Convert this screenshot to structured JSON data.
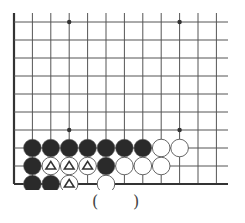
{
  "diagram": {
    "type": "go-problem",
    "grid": {
      "columns": 12,
      "rows": 10,
      "left_edge_col": 0,
      "bottom_edge_row": 9,
      "origin_x": 14,
      "origin_y": 22,
      "col_spacing": 18.4,
      "row_spacing": 18,
      "line_right_extent": 228,
      "line_top_extent": 13,
      "star_points": [
        [
          3,
          0
        ],
        [
          9,
          0
        ],
        [
          3,
          6
        ],
        [
          9,
          6
        ]
      ]
    },
    "colors": {
      "line": "#555555",
      "edge": "#333333",
      "black_stone": "#2a2a2a",
      "white_stone": "#ffffff",
      "stone_outline": "#555555",
      "marker": "#333333"
    },
    "stones": [
      {
        "color": "black",
        "col": 1,
        "row": 7
      },
      {
        "color": "black",
        "col": 2,
        "row": 7
      },
      {
        "color": "black",
        "col": 3,
        "row": 7
      },
      {
        "color": "black",
        "col": 4,
        "row": 7
      },
      {
        "color": "black",
        "col": 5,
        "row": 7
      },
      {
        "color": "black",
        "col": 6,
        "row": 7
      },
      {
        "color": "black",
        "col": 7,
        "row": 7
      },
      {
        "color": "white",
        "col": 8,
        "row": 7
      },
      {
        "color": "white",
        "col": 9,
        "row": 7
      },
      {
        "color": "black",
        "col": 1,
        "row": 8
      },
      {
        "color": "white",
        "col": 2,
        "row": 8,
        "marker": "triangle"
      },
      {
        "color": "white",
        "col": 3,
        "row": 8,
        "marker": "triangle"
      },
      {
        "color": "white",
        "col": 4,
        "row": 8,
        "marker": "triangle"
      },
      {
        "color": "black",
        "col": 5,
        "row": 8
      },
      {
        "color": "white",
        "col": 6,
        "row": 8
      },
      {
        "color": "white",
        "col": 7,
        "row": 8
      },
      {
        "color": "white",
        "col": 8,
        "row": 8
      },
      {
        "color": "black",
        "col": 1,
        "row": 9
      },
      {
        "color": "black",
        "col": 2,
        "row": 9
      },
      {
        "color": "white",
        "col": 3,
        "row": 9,
        "marker": "triangle"
      },
      {
        "color": "white",
        "col": 5,
        "row": 9
      }
    ],
    "answer_blank": {
      "open": "(",
      "close": ")"
    }
  }
}
